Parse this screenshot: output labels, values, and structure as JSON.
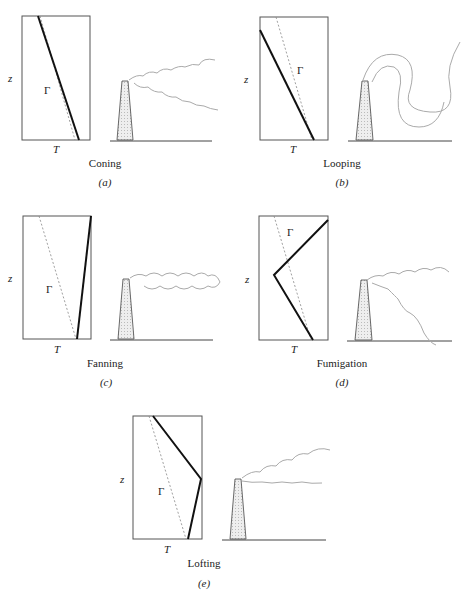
{
  "figure": {
    "panels": [
      {
        "id": "a",
        "name": "Coning",
        "letter": "(a)",
        "z_label": "z",
        "t_label": "T",
        "gamma_label": "Γ"
      },
      {
        "id": "b",
        "name": "Looping",
        "letter": "(b)",
        "z_label": "z",
        "t_label": "T",
        "gamma_label": "Γ"
      },
      {
        "id": "c",
        "name": "Fanning",
        "letter": "(c)",
        "z_label": "z",
        "t_label": "T",
        "gamma_label": "Γ"
      },
      {
        "id": "d",
        "name": "Fumigation",
        "letter": "(d)",
        "z_label": "z",
        "t_label": "T",
        "gamma_label": "Γ"
      },
      {
        "id": "e",
        "name": "Lofting",
        "letter": "(e)",
        "z_label": "z",
        "t_label": "T",
        "gamma_label": "Γ"
      }
    ],
    "colors": {
      "line": "#1a1a1a",
      "dashed": "#555555",
      "plume": "#9a9a9a",
      "stack_fill": "#e6e6e6"
    }
  }
}
